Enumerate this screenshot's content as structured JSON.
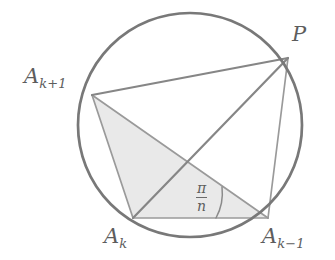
{
  "figure": {
    "kind": "geometry-diagram",
    "width": 335,
    "height": 260,
    "background_color": "#ffffff",
    "stroke_color": "#7f7f7f",
    "thin_stroke_color": "#9a9a9a",
    "circle_stroke_color": "#787878",
    "shade_fill_color": "#e9e9e9",
    "label_color": "#5d5d5d"
  },
  "circle": {
    "center_x": 190,
    "center_y": 125,
    "radius": 112,
    "stroke_width": 2.6
  },
  "points": {
    "P": {
      "x": 288,
      "y": 58,
      "label": "P"
    },
    "A_kplus1": {
      "x": 92,
      "y": 95,
      "label_base": "A",
      "label_sub": "k+1"
    },
    "A_k": {
      "x": 133,
      "y": 218,
      "label_base": "A",
      "label_sub": "k"
    },
    "A_kminus1": {
      "x": 268,
      "y": 218,
      "label_base": "A",
      "label_sub": "k−1"
    }
  },
  "labels": {
    "P": {
      "text": "P",
      "x": 292,
      "y": 24
    },
    "A_kplus1": {
      "base": "A",
      "sub": "k+1",
      "x": 24,
      "y": 66
    },
    "A_k": {
      "base": "A",
      "sub": "k",
      "x": 104,
      "y": 226
    },
    "A_kminus1": {
      "base": "A",
      "sub": "k−1",
      "x": 262,
      "y": 226
    }
  },
  "angle": {
    "vertex": "A_kminus1",
    "numerator": "π",
    "denominator": "n",
    "label_x": 196,
    "label_y": 181,
    "arc_radius": 52,
    "arc_stroke": "#8a8a8a"
  },
  "segments": [
    {
      "name": "A_kplus1-to-P",
      "from": "A_kplus1",
      "to": "P",
      "width": 2.2
    },
    {
      "name": "A_k-to-P",
      "from": "A_k",
      "to": "P",
      "width": 2.2
    },
    {
      "name": "A_kminus1-to-P",
      "from": "A_kminus1",
      "to": "P",
      "width": 1.6
    },
    {
      "name": "A_kplus1-to-A_k",
      "from": "A_kplus1",
      "to": "A_k",
      "width": 1.6
    },
    {
      "name": "A_k-to-A_kminus1",
      "from": "A_k",
      "to": "A_kminus1",
      "width": 1.6
    },
    {
      "name": "A_kplus1-to-A_kminus1",
      "from": "A_kplus1",
      "to": "A_kminus1",
      "width": 1.6
    }
  ],
  "shaded_triangle": {
    "name": "triangle-A_kplus1-A_k-A_kminus1",
    "vertices": [
      "A_kplus1",
      "A_k",
      "A_kminus1"
    ],
    "fill": "#e9e9e9"
  }
}
